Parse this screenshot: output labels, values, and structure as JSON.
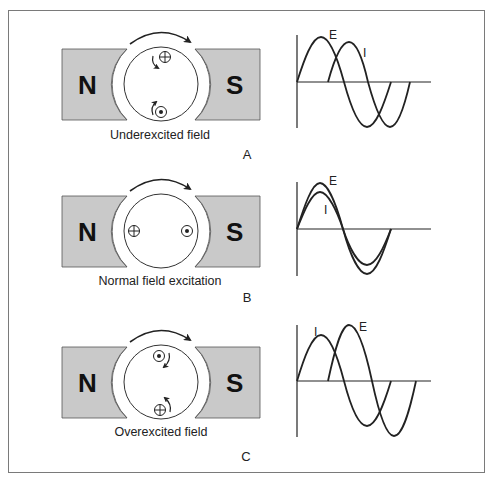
{
  "figure": {
    "border_color": "#7a7a7a",
    "magnet_color": "#c9c9c9",
    "stroke_color": "#222222",
    "panels": [
      {
        "id": "A",
        "letter": "A",
        "caption": "Underexcited field",
        "north_label": "N",
        "south_label": "S",
        "conductors": [
          {
            "type": "cross",
            "position": "top",
            "symbol": "⊕"
          },
          {
            "type": "dot",
            "position": "bottom",
            "symbol": "⊙"
          }
        ],
        "waveform": {
          "labels": {
            "E": "E",
            "I": "I"
          },
          "relationship": "current lags voltage"
        }
      },
      {
        "id": "B",
        "letter": "B",
        "caption": "Normal field excitation",
        "north_label": "N",
        "south_label": "S",
        "conductors": [
          {
            "type": "cross",
            "position": "left",
            "symbol": "⊕"
          },
          {
            "type": "dot",
            "position": "right",
            "symbol": "⊙"
          }
        ],
        "waveform": {
          "labels": {
            "E": "E",
            "I": "I"
          },
          "relationship": "current in phase with voltage"
        }
      },
      {
        "id": "C",
        "letter": "C",
        "caption": "Overexcited field",
        "north_label": "N",
        "south_label": "S",
        "conductors": [
          {
            "type": "dot",
            "position": "top",
            "symbol": "⊙"
          },
          {
            "type": "cross",
            "position": "bottom",
            "symbol": "⊕"
          }
        ],
        "waveform": {
          "labels": {
            "E": "E",
            "I": "I"
          },
          "relationship": "current leads voltage"
        }
      }
    ]
  }
}
